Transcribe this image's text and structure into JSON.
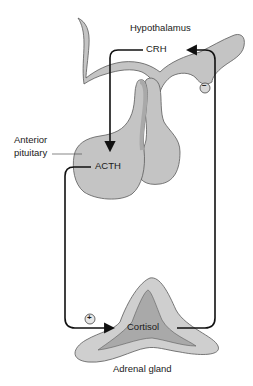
{
  "diagram": {
    "labels": {
      "hypothalamus": "Hypothalamus",
      "crh": "CRH",
      "anterior_pituitary_line1": "Anterior",
      "anterior_pituitary_line2": "pituitary",
      "acth": "ACTH",
      "cortisol": "Cortisol",
      "adrenal_gland": "Adrenal gland",
      "negative_feedback_sign": "−",
      "positive_sign": "+"
    },
    "colors": {
      "gland_fill": "#c4c4c4",
      "gland_dark": "#a9a9a9",
      "outline": "#5a5a5a",
      "arrow": "#111111",
      "background": "#ffffff"
    },
    "flow": [
      {
        "from": "Hypothalamus",
        "signal": "CRH",
        "to": "Anterior pituitary",
        "effect": "stimulates"
      },
      {
        "from": "Anterior pituitary",
        "signal": "ACTH",
        "to": "Adrenal gland",
        "effect": "+"
      },
      {
        "from": "Adrenal gland",
        "signal": "Cortisol",
        "to": "Hypothalamus",
        "effect": "−"
      }
    ]
  }
}
